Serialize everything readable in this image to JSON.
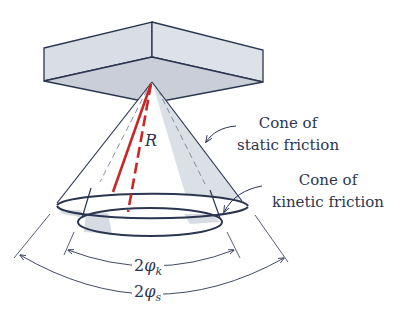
{
  "figure": {
    "colors": {
      "ink": "#2b3550",
      "block_fill": "#d9dde5",
      "block_bottom_fill": "#c9ced8",
      "cone_shade": "#d7dbe3",
      "resultant": "#c62828",
      "background": "#ffffff"
    }
  },
  "labels": {
    "static_cone": {
      "line1": "Cone of",
      "line2": "static friction"
    },
    "kinetic_cone": {
      "line1": "Cone of",
      "line2": "kinetic friction"
    },
    "resultant": "R",
    "kinetic_angle": {
      "prefix": "2",
      "symbol": "φ",
      "subscript": "k"
    },
    "static_angle": {
      "prefix": "2",
      "symbol": "φ",
      "subscript": "s"
    }
  }
}
